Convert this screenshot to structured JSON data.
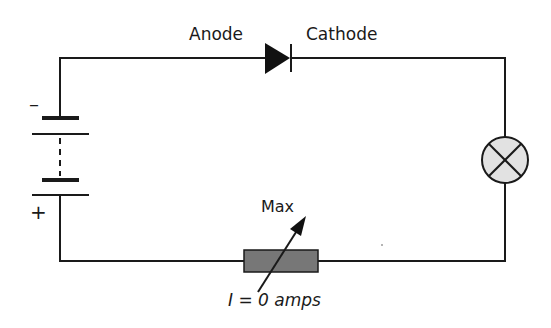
{
  "diagram": {
    "type": "circuit",
    "labels": {
      "anode": "Anode",
      "cathode": "Cathode",
      "battery_negative": "–",
      "battery_positive": "+",
      "rheostat_setting": "Max",
      "current": "I = 0 amps"
    },
    "components": [
      {
        "id": "battery",
        "kind": "multi-cell battery"
      },
      {
        "id": "diode",
        "kind": "diode",
        "orientation": "reverse-biased"
      },
      {
        "id": "lamp",
        "kind": "lamp"
      },
      {
        "id": "rheostat",
        "kind": "variable resistor"
      }
    ],
    "colors": {
      "wire": "#1a1a1a",
      "lamp_fill": "#e2e2e2",
      "resistor_fill": "#777777"
    }
  }
}
